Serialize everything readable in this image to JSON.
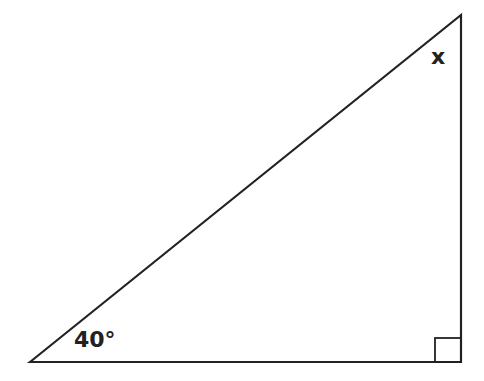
{
  "diagram": {
    "type": "right-triangle",
    "vertices": {
      "bottom_left": [
        30,
        362
      ],
      "top_right": [
        461,
        15
      ],
      "bottom_right": [
        461,
        362
      ]
    },
    "right_angle_marker": {
      "x": 435,
      "y": 338,
      "size": 26
    },
    "labels": {
      "bottom_left_angle": "40°",
      "top_angle": "x"
    },
    "stroke_color": "#222222"
  }
}
